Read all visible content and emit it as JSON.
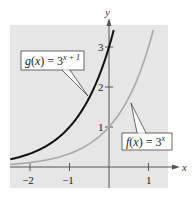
{
  "chart_data": {
    "type": "line",
    "title": "",
    "xlabel": "x",
    "ylabel": "y",
    "xlim": [
      -2.5,
      1.5
    ],
    "ylim": [
      0,
      3.5
    ],
    "grid": false,
    "x_ticks": [
      {
        "value": -2,
        "label": "−2"
      },
      {
        "value": -1,
        "label": "−1"
      },
      {
        "value": 1,
        "label": "1"
      }
    ],
    "y_ticks": [
      {
        "value": 1,
        "label": "1"
      },
      {
        "value": 2,
        "label": "2"
      },
      {
        "value": 3,
        "label": "3"
      }
    ],
    "series": [
      {
        "name": "g(x) = 3^(x+1)",
        "color": "#111111",
        "x": [
          -2.5,
          -2,
          -1.5,
          -1,
          -0.5,
          0,
          0.13
        ],
        "y": [
          0.19,
          0.33,
          0.58,
          1.0,
          1.73,
          3.0,
          3.46
        ]
      },
      {
        "name": "f(x) = 3^x",
        "color": "#a8a8a8",
        "x": [
          -2.5,
          -2,
          -1.5,
          -1,
          -0.5,
          0,
          0.5,
          1,
          1.13
        ],
        "y": [
          0.06,
          0.11,
          0.19,
          0.33,
          0.58,
          1.0,
          1.73,
          3.0,
          3.46
        ]
      }
    ],
    "annotations": [
      {
        "text_main": "g(x) = 3",
        "superscript": "x + 1",
        "points_to": "g curve"
      },
      {
        "text_main": "f(x) = 3",
        "superscript": "x",
        "points_to": "f curve"
      }
    ]
  },
  "colors": {
    "panel": "#e6e6e6",
    "axis": "#555555",
    "g_curve": "#111111",
    "f_curve": "#a8a8a8"
  }
}
